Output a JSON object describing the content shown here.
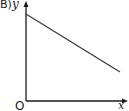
{
  "option_label": "B)",
  "axes": {
    "y_label": "y",
    "x_label": "x",
    "origin_label": "O"
  },
  "colors": {
    "ink": "#1a1a1a",
    "line": "#3a3a3a",
    "background": "#ffffff"
  },
  "line": {
    "description": "straight line with negative slope, positive y-intercept",
    "start": {
      "x": 26,
      "y": 14
    },
    "end": {
      "x": 120,
      "y": 72
    }
  }
}
